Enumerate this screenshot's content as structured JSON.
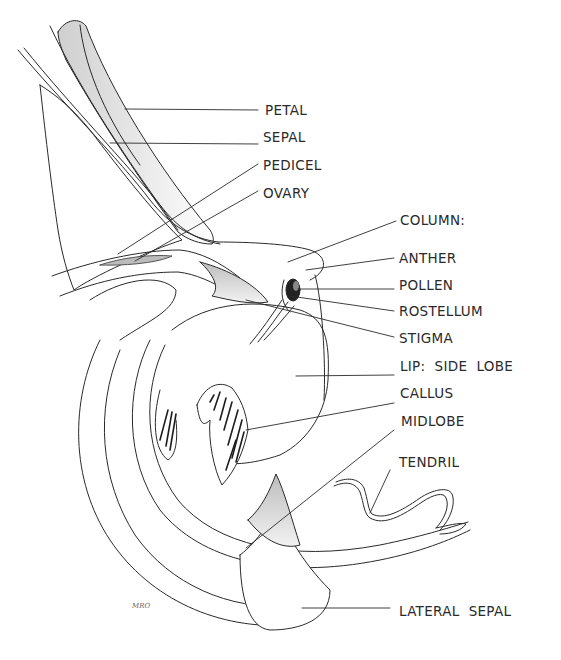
{
  "diagram": {
    "labels": [
      {
        "id": "petal",
        "text": "PETAL",
        "x": 265,
        "y": 102
      },
      {
        "id": "sepal",
        "text": "SEPAL",
        "x": 263,
        "y": 129
      },
      {
        "id": "pedicel",
        "text": "PEDICEL",
        "x": 263,
        "y": 157
      },
      {
        "id": "ovary",
        "text": "OVARY",
        "x": 263,
        "y": 185
      },
      {
        "id": "column",
        "text": "COLUMN:",
        "x": 400,
        "y": 212
      },
      {
        "id": "anther",
        "text": "ANTHER",
        "x": 399,
        "y": 250
      },
      {
        "id": "pollen",
        "text": "POLLEN",
        "x": 399,
        "y": 277
      },
      {
        "id": "rostellum",
        "text": "ROSTELLUM",
        "x": 399,
        "y": 303
      },
      {
        "id": "stigma",
        "text": "STIGMA",
        "x": 399,
        "y": 330
      },
      {
        "id": "lip-side-lobe",
        "text": "LIP:  SIDE  LOBE",
        "x": 400,
        "y": 358
      },
      {
        "id": "callus",
        "text": "CALLUS",
        "x": 400,
        "y": 385
      },
      {
        "id": "midlobe",
        "text": "MIDLOBE",
        "x": 401,
        "y": 413
      },
      {
        "id": "tendril",
        "text": "TENDRIL",
        "x": 399,
        "y": 454
      },
      {
        "id": "lateral-sepal",
        "text": "LATERAL  SEPAL",
        "x": 399,
        "y": 603
      }
    ],
    "signature": "MRO",
    "colors": {
      "ink": "#2a2a2a",
      "shade": "#d4d4d4",
      "dark_shade": "#1e1e1e",
      "paper": "#ffffff"
    }
  }
}
